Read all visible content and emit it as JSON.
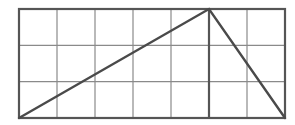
{
  "diagram": {
    "type": "grid-triangle",
    "background": "#ffffff",
    "grid": {
      "columns": 7,
      "rows": 3,
      "origin_px": [
        19,
        9
      ],
      "cell_width_px": 38,
      "cell_height_px": 36.33,
      "line_color": "#8a8a8a",
      "border_color": "#555555"
    },
    "triangle": {
      "vertices_grid": [
        [
          0,
          3
        ],
        [
          5,
          0
        ],
        [
          7,
          3
        ]
      ],
      "vertices_px": [
        [
          19,
          118
        ],
        [
          209,
          9
        ],
        [
          285,
          118
        ]
      ],
      "edge_color": "#4a4a4a"
    },
    "altitude": {
      "from_grid": [
        5,
        0
      ],
      "to_grid": [
        5,
        3
      ],
      "from_px": [
        209,
        9
      ],
      "to_px": [
        209,
        118
      ]
    }
  }
}
